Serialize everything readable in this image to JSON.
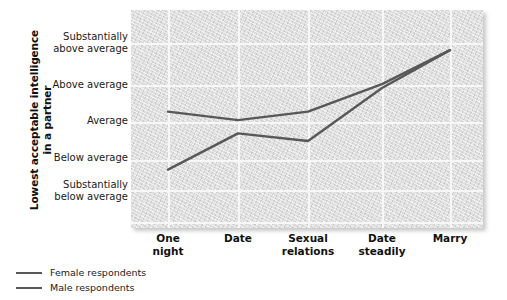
{
  "chart_data": {
    "type": "line",
    "title": "",
    "xlabel": "",
    "ylabel": "Lowest acceptable intelligence in a partner",
    "ylabel_lines": [
      "Lowest acceptable intelligence",
      "in a partner"
    ],
    "categories": [
      "One night",
      "Date",
      "Sexual relations",
      "Date steadily",
      "Marry"
    ],
    "category_lines": [
      [
        "One",
        "night"
      ],
      [
        "Date"
      ],
      [
        "Sexual",
        "relations"
      ],
      [
        "Date",
        "steadily"
      ],
      [
        "Marry"
      ]
    ],
    "ytick_labels": [
      "Substantially above average",
      "Above average",
      "Average",
      "Below average",
      "Substantially below average"
    ],
    "ytick_lines": [
      [
        "Substantially",
        "above average"
      ],
      [
        "Above average"
      ],
      [
        "Average"
      ],
      [
        "Below average"
      ],
      [
        "Substantially",
        "below average"
      ]
    ],
    "ytick_values": [
      5,
      4,
      3,
      2,
      1
    ],
    "ylim": [
      0.5,
      5.6
    ],
    "grid": true,
    "legend_position": "below-left",
    "series": [
      {
        "name": "Female respondents",
        "color": "#585858",
        "values": [
          3.28,
          3.05,
          3.28,
          4.02,
          4.83
        ]
      },
      {
        "name": "Male respondents",
        "color": "#585858",
        "values": [
          1.68,
          2.7,
          2.5,
          3.92,
          4.83
        ]
      }
    ]
  },
  "colors": {
    "panel_background": "#dddddd",
    "gridline": "#f7f7f7",
    "line": "#585858",
    "text": "#111111",
    "page_background": "#ffffff"
  },
  "legend": {
    "items": [
      {
        "label": "Female respondents"
      },
      {
        "label": "Male respondents"
      }
    ]
  }
}
